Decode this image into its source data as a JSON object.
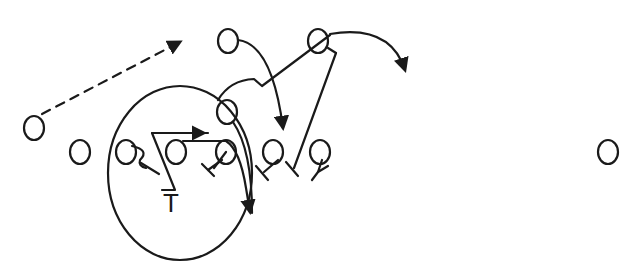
{
  "diagram": {
    "type": "football-play-diagram",
    "stroke_color": "#1a1a1a",
    "background": "#ffffff",
    "players": [
      {
        "id": "wingback-left",
        "symbol": "O",
        "x": 34,
        "y": 128
      },
      {
        "id": "line-1",
        "symbol": "O",
        "x": 80,
        "y": 152
      },
      {
        "id": "line-2",
        "symbol": "O",
        "x": 126,
        "y": 152
      },
      {
        "id": "line-3",
        "symbol": "O",
        "x": 176,
        "y": 152
      },
      {
        "id": "line-4",
        "symbol": "O",
        "x": 226,
        "y": 152
      },
      {
        "id": "line-5",
        "symbol": "O",
        "x": 270,
        "y": 152
      },
      {
        "id": "line-6",
        "symbol": "O",
        "x": 320,
        "y": 152
      },
      {
        "id": "back-up-left",
        "symbol": "O",
        "x": 228,
        "y": 40
      },
      {
        "id": "back-up-right",
        "symbol": "O",
        "x": 318,
        "y": 40
      },
      {
        "id": "back-mid",
        "symbol": "O",
        "x": 226,
        "y": 110
      },
      {
        "id": "end-far-right",
        "symbol": "O",
        "x": 608,
        "y": 152
      }
    ],
    "target_label": {
      "text": "T",
      "x": 173,
      "y": 206
    },
    "zone": {
      "shape": "ellipse",
      "cx": 180,
      "cy": 173,
      "rx": 72,
      "ry": 86
    }
  }
}
